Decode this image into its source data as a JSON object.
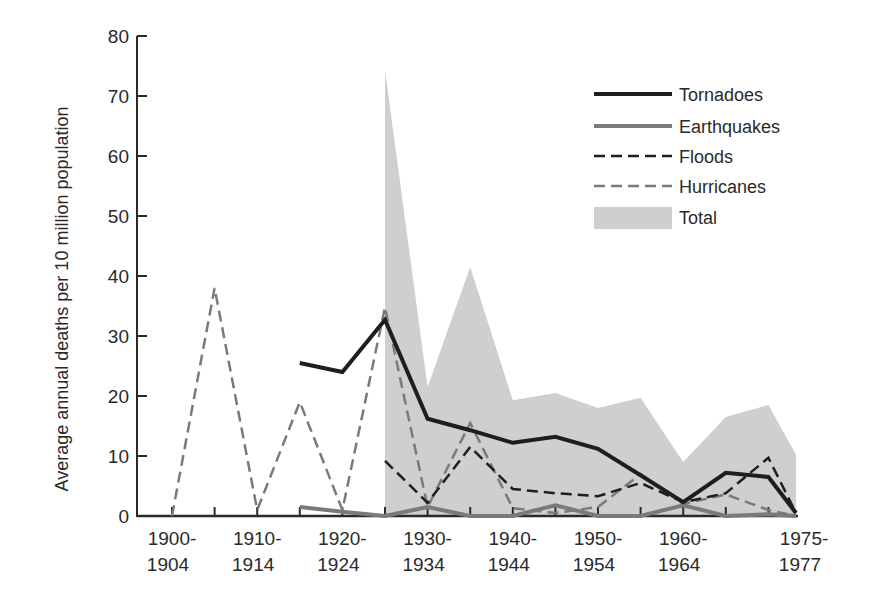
{
  "chart_data": {
    "type": "line",
    "title": "",
    "xlabel": "",
    "ylabel": "Average annual deaths per 10 million population",
    "ylim": [
      0,
      80
    ],
    "yticks": [
      0,
      10,
      20,
      30,
      40,
      50,
      60,
      70,
      80
    ],
    "grid": false,
    "legend_position": "upper right",
    "x": [
      "1900-1904",
      "1905-1909",
      "1910-1914",
      "1915-1919",
      "1920-1924",
      "1925-1929",
      "1930-1934",
      "1935-1939",
      "1940-1944",
      "1945-1949",
      "1950-1954",
      "1955-1959",
      "1960-1964",
      "1965-1969",
      "1970-1974",
      "1975-1977"
    ],
    "xtick_labels": [
      {
        "index": 0,
        "line1": "1900-",
        "line2": "1904"
      },
      {
        "index": 2,
        "line1": "1910-",
        "line2": "1914"
      },
      {
        "index": 4,
        "line1": "1920-",
        "line2": "1924"
      },
      {
        "index": 6,
        "line1": "1930-",
        "line2": "1934"
      },
      {
        "index": 8,
        "line1": "1940-",
        "line2": "1944"
      },
      {
        "index": 10,
        "line1": "1950-",
        "line2": "1954"
      },
      {
        "index": 12,
        "line1": "1960-",
        "line2": "1964"
      },
      {
        "index": 15,
        "line1": "1975-",
        "line2": "1977"
      }
    ],
    "series": [
      {
        "name": "Tornadoes",
        "style": "solid",
        "color": "#1e1e1e",
        "width": 4,
        "values": [
          null,
          null,
          null,
          25.5,
          24,
          32.7,
          16.2,
          14.3,
          12.2,
          13.2,
          11.2,
          6.8,
          2.3,
          7.2,
          6.5,
          0.5
        ]
      },
      {
        "name": "Earthquakes",
        "style": "solid",
        "color": "#7a7a7a",
        "width": 4,
        "values": [
          null,
          15.5,
          null,
          1.5,
          0.7,
          0,
          1.5,
          0,
          0,
          1.8,
          0,
          0,
          1.8,
          0,
          0.3,
          0
        ]
      },
      {
        "name": "Floods",
        "style": "dashed",
        "color": "#1e1e1e",
        "width": 2.5,
        "values": [
          null,
          null,
          null,
          null,
          null,
          9.2,
          2.2,
          11.5,
          4.5,
          3.8,
          3.3,
          5.5,
          2.3,
          3.8,
          9.7,
          0.5
        ]
      },
      {
        "name": "Hurricanes",
        "style": "dashed",
        "color": "#7a7a7a",
        "width": 2.5,
        "values": [
          0,
          38,
          1,
          19,
          1,
          34.8,
          1.5,
          15.5,
          1.3,
          0.5,
          1.5,
          7.0,
          2.0,
          3.6,
          1.0,
          0
        ]
      },
      {
        "name": "Total",
        "style": "area",
        "color": "#cfcfcf",
        "values": [
          null,
          null,
          null,
          null,
          null,
          74.3,
          21.5,
          41.5,
          19.3,
          20.5,
          18,
          19.7,
          9,
          16.5,
          18.5,
          10.2
        ]
      }
    ]
  },
  "legend": {
    "items": [
      {
        "label": "Tornadoes"
      },
      {
        "label": "Earthquakes"
      },
      {
        "label": "Floods"
      },
      {
        "label": "Hurricanes"
      },
      {
        "label": "Total"
      }
    ]
  }
}
